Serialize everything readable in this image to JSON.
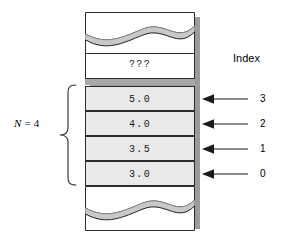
{
  "figure": {
    "name": "array-index-diagram",
    "colors": {
      "cell_fill": "#e9e9e9",
      "empty_fill": "#ffffff",
      "outline": "#2b2b2b",
      "shadow": "#9b9b9b",
      "gap_strip": "#a8a8a8",
      "wave_fill": "#c9c9c9",
      "text": "#000000"
    }
  },
  "left_annotation": {
    "variable": "N",
    "equals": " = ",
    "value": "4",
    "brace_name": "curly-brace"
  },
  "array": {
    "unused_cell": {
      "label": "???",
      "fill": "empty"
    },
    "cells": [
      {
        "value": "5.0",
        "index": "3",
        "fill": "filled"
      },
      {
        "value": "4.0",
        "index": "2",
        "fill": "filled"
      },
      {
        "value": "3.5",
        "index": "1",
        "fill": "filled"
      },
      {
        "value": "3.0",
        "index": "0",
        "fill": "filled"
      }
    ],
    "break_top": "wavy-break",
    "break_bottom": "wavy-break"
  },
  "right_annotation": {
    "title": "Index",
    "indices": [
      "3",
      "2",
      "1",
      "0"
    ]
  }
}
